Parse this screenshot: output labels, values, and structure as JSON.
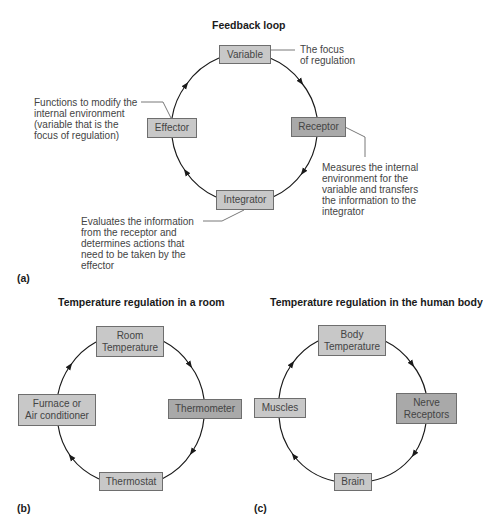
{
  "panel_a": {
    "label": "(a)",
    "title": "Feedback loop",
    "nodes": {
      "variable": "Variable",
      "receptor": "Receptor",
      "integrator": "Integrator",
      "effector": "Effector"
    },
    "annotations": {
      "variable": "The focus\nof regulation",
      "receptor": "Measures the internal\nenvironment for the\nvariable and transfers\nthe information to the\nintegrator",
      "integrator": "Evaluates the information\nfrom the receptor and\ndetermines actions that\nneed to be taken by the\neffector",
      "effector": "Functions to modify the\ninternal environment\n(variable that is the\nfocus of regulation)"
    }
  },
  "panel_b": {
    "label": "(b)",
    "title": "Temperature regulation in a room",
    "nodes": {
      "variable": "Room\nTemperature",
      "receptor": "Thermometer",
      "integrator": "Thermostat",
      "effector": "Furnace or\nAir conditioner"
    }
  },
  "panel_c": {
    "label": "(c)",
    "title": "Temperature regulation in the human body",
    "nodes": {
      "variable": "Body\nTemperature",
      "receptor": "Nerve\nReceptors",
      "integrator": "Brain",
      "effector": "Muscles"
    }
  },
  "colors": {
    "box_fill": "#c8c8c8",
    "box_fill_dark": "#a9a9a9",
    "box_border": "#6e6e6e",
    "loop_line": "#1a1a1a",
    "text": "#444444"
  }
}
